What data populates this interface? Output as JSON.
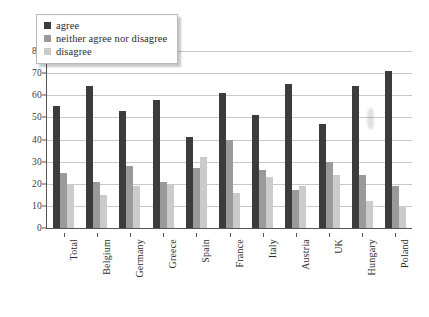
{
  "chart_data": {
    "type": "bar",
    "title": "",
    "xlabel": "",
    "ylabel": "",
    "ylim": [
      0,
      80
    ],
    "yticks": [
      0,
      10,
      20,
      30,
      40,
      50,
      60,
      70,
      80
    ],
    "grid": true,
    "legend_position": "top-left",
    "categories": [
      "Total",
      "Belgium",
      "Germany",
      "Greece",
      "Spain",
      "France",
      "Italy",
      "Austria",
      "UK",
      "Hungary",
      "Poland"
    ],
    "series": [
      {
        "name": "agree",
        "color": "#3c3c3c",
        "values": [
          55,
          64,
          53,
          58,
          41,
          61,
          51,
          65,
          47,
          64,
          71
        ]
      },
      {
        "name": "neither agree nor disagree",
        "color": "#9a9a9a",
        "values": [
          25,
          21,
          28,
          21,
          27,
          40,
          26,
          17,
          30,
          24,
          19
        ]
      },
      {
        "name": "disagree",
        "color": "#cbcbcb",
        "values": [
          20,
          15,
          19,
          20,
          32,
          16,
          23,
          19,
          24,
          12,
          10
        ]
      }
    ]
  },
  "legend": {
    "items": [
      {
        "label": "agree",
        "swatch": "legend-swatch-agree"
      },
      {
        "label": "neither agree nor disagree",
        "swatch": "legend-swatch-neither"
      },
      {
        "label": "disagree",
        "swatch": "legend-swatch-disagree"
      }
    ]
  }
}
